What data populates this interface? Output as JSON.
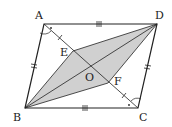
{
  "figure": {
    "type": "parallelogram-geometry",
    "vertices": {
      "A": "A",
      "B": "B",
      "C": "C",
      "D": "D"
    },
    "points": {
      "E": "E",
      "F": "F",
      "O": "O"
    },
    "colors": {
      "stroke": "#222222",
      "fill": "#d0d0d0"
    },
    "marks": {
      "AD_BC": "triple tick",
      "AB_DC": "double tick",
      "AE_FC": "single tick",
      "angles": "angle A-side and C-side marked equal with dot"
    }
  }
}
